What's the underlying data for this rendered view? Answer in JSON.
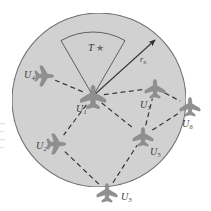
{
  "figure": {
    "canvas": {
      "width": 211,
      "height": 211
    },
    "colors": {
      "region_fill": "#d2d2d2",
      "region_stroke": "#6b6b6b",
      "sector_fill": "#cfcfcf",
      "sector_stroke": "#5f5f5f",
      "link_stroke": "#2f2f2f",
      "uav_fill": "#8f8f8f",
      "label_text": "#3a3a3a",
      "star_fill": "#6e6e6e",
      "arrow_stroke": "#3a3a3a",
      "background": "#ffffff"
    }
  },
  "coverage_region": {
    "name": "coverage-circle",
    "center": {
      "x": 99,
      "y": 100
    },
    "radius": 87
  },
  "sector": {
    "name": "sensing-sector",
    "apex": {
      "x": 93,
      "y": 96
    },
    "inner_label": "T",
    "star_glyph": "★"
  },
  "radius_arrow": {
    "name": "radius-arrow",
    "label": "r",
    "subscript": "n",
    "from": {
      "x": 93,
      "y": 96
    },
    "to": {
      "x": 155,
      "y": 40
    }
  },
  "target": {
    "label": "T",
    "glyph": "★"
  },
  "nodes": [
    {
      "id": "U1",
      "label": "U",
      "subscript": "1",
      "x": 93,
      "y": 96,
      "label_x": 76,
      "label_y": 104,
      "scale": 1.25,
      "rotation": 0,
      "inside": true
    },
    {
      "id": "U4",
      "label": "U",
      "subscript": "4",
      "x": 45,
      "y": 76,
      "label_x": 24,
      "label_y": 70,
      "scale": 1.0,
      "rotation": 90,
      "inside": true
    },
    {
      "id": "U2",
      "label": "U",
      "subscript": "2",
      "x": 57,
      "y": 144,
      "label_x": 36,
      "label_y": 141,
      "scale": 1.0,
      "rotation": 90,
      "inside": true
    },
    {
      "id": "U3",
      "label": "U",
      "subscript": "3",
      "x": 107,
      "y": 192,
      "label_x": 121,
      "label_y": 192,
      "scale": 1.0,
      "rotation": 0,
      "inside": false
    },
    {
      "id": "U5",
      "label": "U",
      "subscript": "5",
      "x": 143,
      "y": 136,
      "label_x": 150,
      "label_y": 147,
      "scale": 1.0,
      "rotation": 0,
      "inside": true
    },
    {
      "id": "U7",
      "label": "U",
      "subscript": "7",
      "x": 155,
      "y": 88,
      "label_x": 140,
      "label_y": 100,
      "scale": 1.0,
      "rotation": 0,
      "inside": true
    },
    {
      "id": "U6",
      "label": "U",
      "subscript": "6",
      "x": 190,
      "y": 106,
      "label_x": 182,
      "label_y": 119,
      "scale": 1.0,
      "rotation": 0,
      "inside": false
    }
  ],
  "links": [
    {
      "from": "U1",
      "to": "U4"
    },
    {
      "from": "U1",
      "to": "U2"
    },
    {
      "from": "U1",
      "to": "U5"
    },
    {
      "from": "U1",
      "to": "U7"
    },
    {
      "from": "U2",
      "to": "U3"
    },
    {
      "from": "U3",
      "to": "U5"
    },
    {
      "from": "U5",
      "to": "U7"
    },
    {
      "from": "U5",
      "to": "U6"
    },
    {
      "from": "U7",
      "to": "U6"
    }
  ]
}
